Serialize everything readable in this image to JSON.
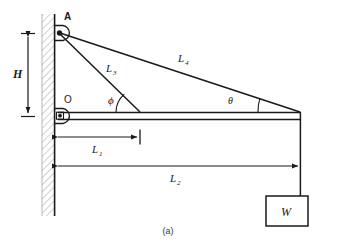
{
  "figure": {
    "caption": "(a)",
    "type": "statics-free-body-diagram"
  },
  "labels": {
    "point_a": "A",
    "point_o": "O",
    "height": "H",
    "angle_phi": "ϕ",
    "angle_theta": "θ",
    "weight": "W",
    "len1_base": "L",
    "len1_sub": "1",
    "len2_base": "L",
    "len2_sub": "2",
    "len3_base": "L",
    "len3_sub": "3",
    "len4_base": "L",
    "len4_sub": "4"
  },
  "colors": {
    "line": "#1a1a1a",
    "hatch": "#8a8a8a",
    "background": "#ffffff",
    "caption": "#3a3a3a"
  },
  "geometry": {
    "wall_x_left": 42,
    "wall_x_right": 55,
    "point_a": [
      58,
      33
    ],
    "point_o": [
      58,
      116
    ],
    "beam_right_x": 300,
    "beam_y": 116,
    "tie_foot_x": 140,
    "weight_box": [
      266,
      196,
      42,
      30
    ]
  }
}
